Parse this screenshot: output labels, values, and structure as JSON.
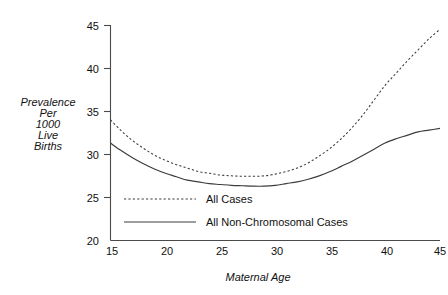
{
  "chart_data": {
    "type": "line",
    "title": "",
    "xlabel": "Maternal Age",
    "ylabel": "Prevalence Per 1000 Live Births",
    "ylabel_lines": [
      "Prevalence",
      "Per",
      "1000",
      "Live",
      "Births"
    ],
    "xlim": [
      15,
      45
    ],
    "ylim": [
      20,
      45
    ],
    "xticks": [
      15,
      20,
      25,
      30,
      35,
      40,
      45
    ],
    "yticks": [
      20,
      25,
      30,
      35,
      40,
      45
    ],
    "xtick_labels": [
      "15",
      "20",
      "25",
      "30",
      "35",
      "40",
      "45"
    ],
    "ytick_labels": [
      "20",
      "25",
      "30",
      "35",
      "40",
      "45"
    ],
    "grid": false,
    "legend_position": "inside-lower-left",
    "series": [
      {
        "name": "All Cases",
        "style": "dashed",
        "color": "#3c3c3c",
        "x": [
          15,
          16,
          17,
          18,
          19,
          20,
          21,
          22,
          23,
          24,
          25,
          26,
          27,
          28,
          29,
          30,
          31,
          32,
          33,
          34,
          35,
          36,
          37,
          38,
          39,
          40,
          41,
          42,
          43,
          44,
          45
        ],
        "y": [
          34.0,
          32.7,
          31.6,
          30.7,
          29.9,
          29.3,
          28.8,
          28.4,
          28.0,
          27.8,
          27.6,
          27.5,
          27.45,
          27.45,
          27.5,
          27.7,
          28.0,
          28.4,
          29.0,
          29.8,
          30.7,
          31.8,
          33.1,
          34.6,
          36.3,
          38.0,
          39.4,
          40.8,
          42.1,
          43.4,
          44.5
        ]
      },
      {
        "name": "All Non-Chromosomal Cases",
        "style": "solid",
        "color": "#3c3c3c",
        "x": [
          15,
          16,
          17,
          18,
          19,
          20,
          21,
          22,
          23,
          24,
          25,
          26,
          27,
          28,
          29,
          30,
          31,
          32,
          33,
          34,
          35,
          36,
          37,
          38,
          39,
          40,
          41,
          42,
          43,
          44,
          45
        ],
        "y": [
          31.3,
          30.4,
          29.6,
          28.9,
          28.3,
          27.8,
          27.4,
          27.0,
          26.8,
          26.6,
          26.5,
          26.4,
          26.35,
          26.3,
          26.3,
          26.4,
          26.6,
          26.8,
          27.1,
          27.5,
          28.0,
          28.6,
          29.2,
          29.9,
          30.6,
          31.3,
          31.8,
          32.2,
          32.6,
          32.8,
          33.0
        ]
      }
    ],
    "legend": [
      {
        "label": "All Cases",
        "style": "dashed"
      },
      {
        "label": "All Non-Chromosomal Cases",
        "style": "solid"
      }
    ]
  }
}
